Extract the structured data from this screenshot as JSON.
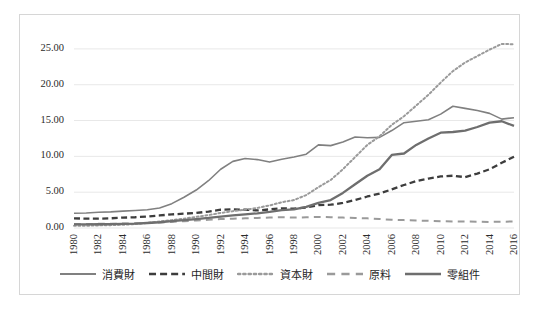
{
  "chart_data": {
    "type": "line",
    "title": "",
    "subtitle": "",
    "xlabel": "",
    "ylabel": "",
    "grid": true,
    "legend_position": "bottom",
    "ylim": [
      0,
      27.5
    ],
    "yticks": [
      "0.00",
      "5.00",
      "10.00",
      "15.00",
      "20.00",
      "25.00"
    ],
    "ytick_values": [
      0,
      5,
      10,
      15,
      20,
      25
    ],
    "x": [
      1980,
      1981,
      1982,
      1983,
      1984,
      1985,
      1986,
      1987,
      1988,
      1989,
      1990,
      1991,
      1992,
      1993,
      1994,
      1995,
      1996,
      1997,
      1998,
      1999,
      2000,
      2001,
      2002,
      2003,
      2004,
      2005,
      2006,
      2007,
      2008,
      2009,
      2010,
      2011,
      2012,
      2013,
      2014,
      2015,
      2016
    ],
    "xticks": [
      "1980",
      "1982",
      "1984",
      "1986",
      "1988",
      "1990",
      "1992",
      "1994",
      "1996",
      "1998",
      "2000",
      "2002",
      "2004",
      "2006",
      "2008",
      "2010",
      "2012",
      "2014",
      "2016"
    ],
    "series": [
      {
        "name": "消費財",
        "style": "solid",
        "width": 1.6,
        "color": "#808080",
        "values": [
          2.05,
          2.1,
          2.2,
          2.25,
          2.35,
          2.45,
          2.55,
          2.8,
          3.4,
          4.3,
          5.3,
          6.6,
          8.2,
          9.3,
          9.7,
          9.55,
          9.2,
          9.6,
          9.9,
          10.3,
          11.6,
          11.5,
          12.0,
          12.7,
          12.6,
          12.65,
          13.6,
          14.7,
          14.9,
          15.1,
          15.9,
          17.0,
          16.7,
          16.4,
          16.0,
          15.2,
          15.4
        ]
      },
      {
        "name": "中間財",
        "style": "dashed",
        "width": 2.3,
        "color": "#3d3d3d",
        "values": [
          1.35,
          1.3,
          1.3,
          1.35,
          1.45,
          1.5,
          1.6,
          1.75,
          1.9,
          2.0,
          2.1,
          2.3,
          2.55,
          2.6,
          2.55,
          2.45,
          2.6,
          2.75,
          2.7,
          2.85,
          3.2,
          3.25,
          3.5,
          3.9,
          4.4,
          4.8,
          5.4,
          6.0,
          6.55,
          6.9,
          7.2,
          7.3,
          7.1,
          7.6,
          8.2,
          9.1,
          9.95
        ]
      },
      {
        "name": "資本財",
        "style": "dotted",
        "width": 2.0,
        "color": "#9a9a9a",
        "values": [
          0.3,
          0.32,
          0.36,
          0.4,
          0.45,
          0.55,
          0.7,
          0.9,
          1.1,
          1.3,
          1.55,
          1.8,
          2.1,
          2.35,
          2.55,
          2.8,
          3.15,
          3.6,
          3.9,
          4.6,
          5.7,
          6.7,
          8.2,
          9.9,
          11.6,
          12.8,
          14.4,
          15.6,
          17.1,
          18.6,
          20.3,
          21.9,
          23.1,
          24.0,
          24.9,
          25.7,
          25.65
        ]
      },
      {
        "name": "原料",
        "style": "longdash",
        "width": 2.0,
        "color": "#9a9a9a",
        "values": [
          0.55,
          0.55,
          0.58,
          0.6,
          0.62,
          0.65,
          0.7,
          0.78,
          0.85,
          0.95,
          1.05,
          1.15,
          1.25,
          1.3,
          1.35,
          1.4,
          1.45,
          1.5,
          1.45,
          1.5,
          1.55,
          1.5,
          1.45,
          1.4,
          1.35,
          1.25,
          1.15,
          1.1,
          1.05,
          1.0,
          0.95,
          0.92,
          0.9,
          0.88,
          0.85,
          0.88,
          0.9
        ]
      },
      {
        "name": "零組件",
        "style": "solid",
        "width": 2.3,
        "color": "#6e6e6e",
        "values": [
          0.5,
          0.5,
          0.52,
          0.55,
          0.58,
          0.62,
          0.7,
          0.8,
          0.95,
          1.1,
          1.25,
          1.4,
          1.6,
          1.75,
          1.9,
          2.05,
          2.25,
          2.5,
          2.6,
          2.95,
          3.5,
          3.9,
          4.9,
          6.1,
          7.3,
          8.2,
          10.2,
          10.4,
          11.6,
          12.5,
          13.3,
          13.4,
          13.6,
          14.1,
          14.7,
          14.9,
          14.25
        ]
      }
    ]
  },
  "legend": {
    "items": [
      {
        "label": "消費財",
        "marker": "solid-thin-line-marker"
      },
      {
        "label": "中間財",
        "marker": "dashed-line-marker"
      },
      {
        "label": "資本財",
        "marker": "dotted-line-marker"
      },
      {
        "label": "原料",
        "marker": "long-dash-line-marker"
      },
      {
        "label": "零組件",
        "marker": "solid-thick-line-marker"
      }
    ]
  },
  "colors": {
    "grid": "#e8e8e8",
    "frame": "#d6d6d6",
    "text": "#2b2b2b",
    "background": "#ffffff"
  }
}
